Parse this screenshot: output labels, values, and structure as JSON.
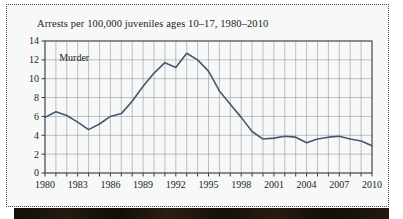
{
  "figure": {
    "title": "Arrests per 100,000 juveniles ages 10–17, 1980–2010",
    "series_label": "Murder",
    "line_color": "#46586e",
    "frame_color": "#4a4a4a",
    "background": "#f7f8f8"
  },
  "chart_data": {
    "type": "line",
    "title": "Arrests per 100,000 juveniles ages 10–17, 1980–2010",
    "xlabel": "",
    "ylabel": "",
    "grid": true,
    "legend": "inline-annotation",
    "xlim": [
      1980,
      2010
    ],
    "ylim": [
      0,
      14
    ],
    "ytick_step": 2,
    "yticks": [
      "0",
      "2",
      "4",
      "6",
      "8",
      "10",
      "12",
      "14"
    ],
    "xticks": [
      "1980",
      "1983",
      "1986",
      "1989",
      "1992",
      "1995",
      "1998",
      "2001",
      "2004",
      "2007",
      "2010"
    ],
    "xtick_minor_step": 1,
    "x": [
      1980,
      1981,
      1982,
      1983,
      1984,
      1985,
      1986,
      1987,
      1988,
      1989,
      1990,
      1991,
      1992,
      1993,
      1994,
      1995,
      1996,
      1997,
      1998,
      1999,
      2000,
      2001,
      2002,
      2003,
      2004,
      2005,
      2006,
      2007,
      2008,
      2009,
      2010
    ],
    "series": [
      {
        "name": "Murder",
        "color": "#46586e",
        "values": [
          5.9,
          6.5,
          6.1,
          5.4,
          4.6,
          5.2,
          6.0,
          6.3,
          7.6,
          9.2,
          10.6,
          11.7,
          11.2,
          12.7,
          12.0,
          10.8,
          8.7,
          7.3,
          5.9,
          4.4,
          3.6,
          3.7,
          3.9,
          3.8,
          3.2,
          3.6,
          3.8,
          3.9,
          3.6,
          3.4,
          2.9
        ]
      }
    ]
  }
}
